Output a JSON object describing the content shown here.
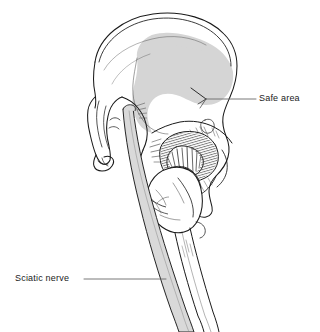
{
  "figure": {
    "kind": "anatomical-line-drawing",
    "background_color": "#ffffff",
    "ink_color": "#1a1a1a",
    "shade_color": "#d5d5d5",
    "width": 320,
    "height": 332
  },
  "labels": [
    {
      "id": "safe-area",
      "text": "Safe area",
      "text_x": 259,
      "text_y": 93,
      "leader": {
        "x1": 205,
        "y1": 99,
        "x2": 256,
        "y2": 99
      }
    },
    {
      "id": "sciatic-nerve",
      "text": "Sciatic nerve",
      "text_x": 15,
      "text_y": 273,
      "leader": {
        "x1": 84,
        "y1": 279,
        "x2": 166,
        "y2": 279
      }
    }
  ],
  "regions": {
    "safe_area_shading": {
      "name": "Safe area",
      "fill": "#d5d5d5",
      "description": "Shaded zone over the posterolateral iliac wing indicating the safe zone for pin or screw placement"
    },
    "sciatic_nerve_band": {
      "name": "Sciatic nerve",
      "fill": "#d9d9d9",
      "description": "Gray band descending obliquely from the greater sciatic notch past the hip joint down the posterior thigh"
    }
  },
  "structures": [
    {
      "name": "iliac-crest"
    },
    {
      "name": "iliac-wing"
    },
    {
      "name": "anterior-superior-iliac-spine"
    },
    {
      "name": "anterior-inferior-iliac-spine"
    },
    {
      "name": "greater-sciatic-notch"
    },
    {
      "name": "acetabulum"
    },
    {
      "name": "femoral-head"
    },
    {
      "name": "femoral-neck"
    },
    {
      "name": "greater-trochanter"
    },
    {
      "name": "lesser-trochanter"
    },
    {
      "name": "ischium"
    },
    {
      "name": "ischial-tuberosity"
    },
    {
      "name": "femoral-shaft"
    }
  ]
}
